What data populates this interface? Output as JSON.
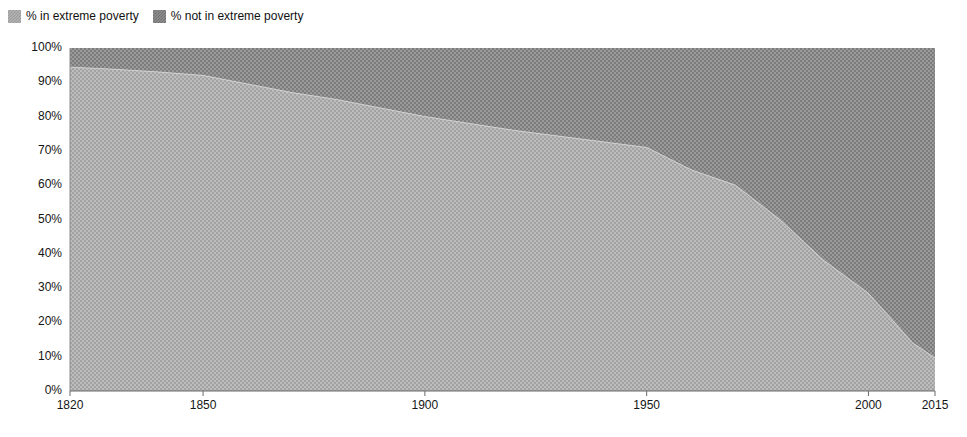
{
  "legend": {
    "position": "top-left",
    "entries": [
      {
        "label": "% in extreme poverty",
        "swatch": "dither-light-swatch",
        "color": "#b2b2b2"
      },
      {
        "label": "% not in extreme poverty",
        "swatch": "dither-dark-swatch",
        "color": "#8e8e8e"
      }
    ]
  },
  "chart_data": {
    "type": "area",
    "stacked": true,
    "title": "",
    "subtitle": "",
    "xlabel": "",
    "ylabel": "",
    "xlim": [
      1820,
      2015
    ],
    "ylim": [
      0,
      100
    ],
    "grid": false,
    "x_tick_labels": [
      "1820",
      "1850",
      "1900",
      "1950",
      "2000",
      "2015"
    ],
    "x_ticks": [
      1820,
      1850,
      1900,
      1950,
      2000,
      2015
    ],
    "y_tick_labels": [
      "0%",
      "10%",
      "20%",
      "30%",
      "40%",
      "50%",
      "60%",
      "70%",
      "80%",
      "90%",
      "100%"
    ],
    "y_ticks": [
      0,
      10,
      20,
      30,
      40,
      50,
      60,
      70,
      80,
      90,
      100
    ],
    "x": [
      1820,
      1830,
      1840,
      1850,
      1860,
      1870,
      1880,
      1890,
      1900,
      1910,
      1920,
      1929,
      1950,
      1960,
      1970,
      1980,
      1990,
      2000,
      2010,
      2015
    ],
    "series": [
      {
        "name": "% in extreme poverty",
        "color": "#b2b2b2",
        "values": [
          94.4,
          93.8,
          93.0,
          92.0,
          89.5,
          87.0,
          85.0,
          82.5,
          80.0,
          78.0,
          76.0,
          74.5,
          71.0,
          64.5,
          60.0,
          50.0,
          38.0,
          28.5,
          14.0,
          9.6
        ]
      },
      {
        "name": "% not in extreme poverty",
        "color": "#8e8e8e",
        "values": [
          5.6,
          6.2,
          7.0,
          8.0,
          10.5,
          13.0,
          15.0,
          17.5,
          20.0,
          22.0,
          24.0,
          25.5,
          29.0,
          35.5,
          40.0,
          50.0,
          62.0,
          71.5,
          86.0,
          90.4
        ]
      }
    ]
  }
}
